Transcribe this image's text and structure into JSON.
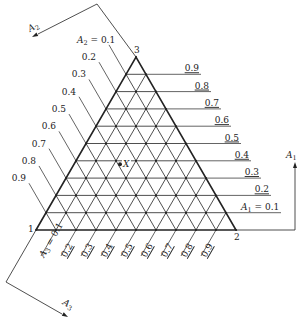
{
  "diagram": {
    "type": "ternary-grid",
    "vertices": [
      {
        "id": "1",
        "label": "1"
      },
      {
        "id": "2",
        "label": "2"
      },
      {
        "id": "3",
        "label": "3"
      }
    ],
    "point": {
      "label": "X",
      "A1": 0.4,
      "A2": 0.4,
      "A3": 0.2
    },
    "axes": {
      "A1": {
        "name": "A",
        "sub": "1",
        "first_label": "A1 = 0.1",
        "ticks": [
          "0.1",
          "0.2",
          "0.3",
          "0.4",
          "0.5",
          "0.6",
          "0.7",
          "0.8",
          "0.9"
        ]
      },
      "A2": {
        "name": "A",
        "sub": "2",
        "first_label": "A2 = 0.1",
        "ticks": [
          "0.1",
          "0.2",
          "0.3",
          "0.4",
          "0.5",
          "0.6",
          "0.7",
          "0.8",
          "0.9"
        ]
      },
      "A3": {
        "name": "A",
        "sub": "3",
        "first_label": "A3 = 0.1",
        "ticks": [
          "0.1",
          "0.2",
          "0.3",
          "0.4",
          "0.5",
          "0.6",
          "0.7",
          "0.8",
          "0.9"
        ]
      }
    },
    "colors": {
      "line": "#222222",
      "background": "#ffffff"
    }
  }
}
